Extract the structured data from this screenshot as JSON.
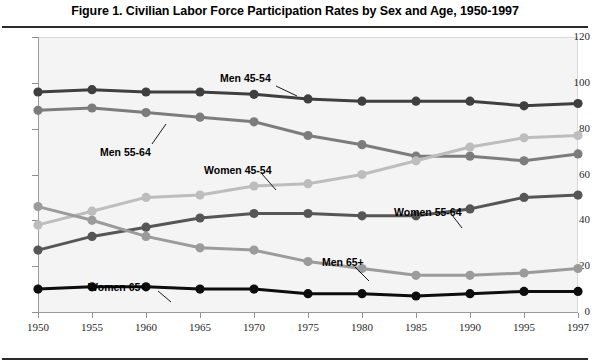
{
  "figure": {
    "title": "Figure 1. Civilian Labor Force Participation Rates by Sex and Age, 1950-1997"
  },
  "annotations": [
    {
      "label": "Men 45-54",
      "x": 220,
      "y": 72,
      "leader": [
        276,
        86,
        297,
        96
      ]
    },
    {
      "label": "Men 55-64",
      "x": 100,
      "y": 146,
      "leader": [
        152,
        144,
        166,
        124
      ]
    },
    {
      "label": "Women 45-54",
      "x": 204,
      "y": 164,
      "leader": [
        262,
        174,
        276,
        190
      ]
    },
    {
      "label": "Women 55-64",
      "x": 394,
      "y": 206,
      "leader": [
        452,
        215,
        462,
        228
      ]
    },
    {
      "label": "Men 65+",
      "x": 322,
      "y": 256,
      "leader": [
        355,
        267,
        369,
        281
      ]
    },
    {
      "label": "Women 65+",
      "x": 88,
      "y": 281,
      "leader": [
        158,
        291,
        171,
        302
      ]
    }
  ],
  "chart_data": {
    "type": "line",
    "title": "Figure 1. Civilian Labor Force Participation Rates by Sex and Age, 1950-1997",
    "xlabel": "",
    "ylabel": "",
    "x": [
      1950,
      1955,
      1960,
      1965,
      1970,
      1975,
      1980,
      1985,
      1990,
      1995,
      1997
    ],
    "categories": [
      "1950",
      "1955",
      "1960",
      "1965",
      "1970",
      "1975",
      "1980",
      "1985",
      "1990",
      "1995",
      "1997"
    ],
    "ylim": [
      0,
      120
    ],
    "yticks": [
      0,
      20,
      40,
      60,
      80,
      100,
      120
    ],
    "grid": false,
    "legend": "inline-annotations",
    "series": [
      {
        "name": "Men 45-54",
        "color": "#3f3f3f",
        "values": [
          96,
          97,
          96,
          96,
          95,
          93,
          92,
          92,
          92,
          90,
          91
        ]
      },
      {
        "name": "Men 55-64",
        "color": "#7c7c7c",
        "values": [
          88,
          89,
          87,
          85,
          83,
          77,
          73,
          68,
          68,
          66,
          69
        ]
      },
      {
        "name": "Women 45-54",
        "color": "#bdbdbd",
        "values": [
          38,
          44,
          50,
          51,
          55,
          56,
          60,
          66,
          72,
          76,
          77
        ]
      },
      {
        "name": "Women 55-64",
        "color": "#565656",
        "values": [
          27,
          33,
          37,
          41,
          43,
          43,
          42,
          42,
          45,
          50,
          51
        ]
      },
      {
        "name": "Men 65+",
        "color": "#9b9b9b",
        "values": [
          46,
          40,
          33,
          28,
          27,
          22,
          19,
          16,
          16,
          17,
          19
        ]
      },
      {
        "name": "Women 65+",
        "color": "#0d0d0d",
        "values": [
          10,
          11,
          11,
          10,
          10,
          8,
          8,
          7,
          8,
          9,
          9
        ]
      }
    ]
  }
}
